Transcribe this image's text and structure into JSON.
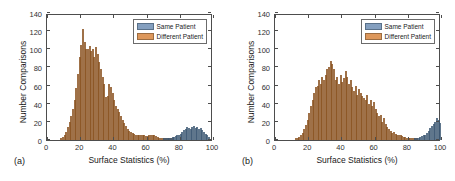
{
  "figure": {
    "panels": [
      {
        "id": "a",
        "label": "(a)",
        "xlabel": "Surface Statistics (%)",
        "ylabel": "Number Comparisons"
      },
      {
        "id": "b",
        "label": "(b)",
        "xlabel": "Surface Statistics (%)",
        "ylabel": "Number Comparisons"
      }
    ],
    "legend": {
      "position": "top-right",
      "entries": [
        {
          "label": "Same Patient",
          "color": "#6f8fb5"
        },
        {
          "label": "Different Patient",
          "color": "#d8853f"
        }
      ]
    },
    "axis": {
      "xticks": [
        "0",
        "20",
        "40",
        "60",
        "80",
        "100"
      ],
      "yticks": [
        "0",
        "20",
        "40",
        "60",
        "80",
        "100",
        "120",
        "140"
      ]
    },
    "colors": {
      "same_patient": "#6f8fb5",
      "different_patient": "#d8853f",
      "axis": "#4d4d4d",
      "background": "#ffffff"
    }
  },
  "chart_data": [
    {
      "type": "bar",
      "subplot": "(a)",
      "title": "",
      "xlabel": "Surface Statistics (%)",
      "ylabel": "Number Comparisons",
      "xlim": [
        0,
        100
      ],
      "ylim": [
        0,
        140
      ],
      "xticks": [
        0,
        20,
        40,
        60,
        80,
        100
      ],
      "yticks": [
        0,
        20,
        40,
        60,
        80,
        100,
        120,
        140
      ],
      "grid": false,
      "legend": [
        "Same Patient",
        "Different Patient"
      ],
      "bin_width": 1,
      "series": [
        {
          "name": "Different Patient",
          "color": "#d8853f",
          "x": [
            8,
            9,
            10,
            11,
            12,
            13,
            14,
            15,
            16,
            17,
            18,
            19,
            20,
            21,
            22,
            23,
            24,
            25,
            26,
            27,
            28,
            29,
            30,
            31,
            32,
            33,
            34,
            35,
            36,
            37,
            38,
            39,
            40,
            41,
            42,
            43,
            44,
            45,
            46,
            47,
            48,
            49,
            50,
            51,
            52,
            53,
            54,
            55,
            56,
            57,
            58,
            59,
            60,
            61,
            62,
            63,
            64,
            65,
            66,
            67,
            68,
            69,
            70,
            71,
            72,
            73,
            74,
            75
          ],
          "values": [
            2,
            3,
            6,
            9,
            14,
            20,
            26,
            34,
            44,
            57,
            73,
            92,
            105,
            122,
            108,
            100,
            100,
            104,
            98,
            100,
            92,
            103,
            95,
            86,
            78,
            70,
            62,
            47,
            49,
            62,
            58,
            52,
            44,
            38,
            34,
            31,
            26,
            22,
            19,
            15,
            12,
            10,
            9,
            8,
            7,
            6,
            6,
            5,
            5,
            5,
            5,
            4,
            4,
            6,
            5,
            5,
            5,
            4,
            3,
            2,
            2,
            2,
            1,
            1,
            1,
            1,
            1,
            1
          ]
        },
        {
          "name": "Same Patient",
          "color": "#6f8fb5",
          "x": [
            70,
            71,
            72,
            73,
            74,
            75,
            76,
            77,
            78,
            79,
            80,
            81,
            82,
            83,
            84,
            85,
            86,
            87,
            88,
            89,
            90,
            91,
            92,
            93,
            94,
            95,
            96,
            97
          ],
          "values": [
            1,
            1,
            2,
            2,
            2,
            3,
            3,
            4,
            5,
            6,
            7,
            9,
            11,
            12,
            14,
            13,
            12,
            14,
            15,
            13,
            14,
            12,
            13,
            11,
            9,
            7,
            5,
            3
          ]
        }
      ]
    },
    {
      "type": "bar",
      "subplot": "(b)",
      "title": "",
      "xlabel": "Surface Statistics (%)",
      "ylabel": "Number Comparisons",
      "xlim": [
        0,
        100
      ],
      "ylim": [
        0,
        140
      ],
      "xticks": [
        0,
        20,
        40,
        60,
        80,
        100
      ],
      "yticks": [
        0,
        20,
        40,
        60,
        80,
        100,
        120,
        140
      ],
      "grid": false,
      "legend": [
        "Same Patient",
        "Different Patient"
      ],
      "bin_width": 1,
      "series": [
        {
          "name": "Different Patient",
          "color": "#d8853f",
          "x": [
            12,
            13,
            14,
            15,
            16,
            17,
            18,
            19,
            20,
            21,
            22,
            23,
            24,
            25,
            26,
            27,
            28,
            29,
            30,
            31,
            32,
            33,
            34,
            35,
            36,
            37,
            38,
            39,
            40,
            41,
            42,
            43,
            44,
            45,
            46,
            47,
            48,
            49,
            50,
            51,
            52,
            53,
            54,
            55,
            56,
            57,
            58,
            59,
            60,
            61,
            62,
            63,
            64,
            65,
            66,
            67,
            68,
            69,
            70,
            71,
            72,
            73,
            74,
            75,
            76,
            77,
            78,
            79,
            80,
            81,
            82,
            83,
            84,
            85
          ],
          "values": [
            1,
            2,
            3,
            5,
            8,
            12,
            17,
            22,
            30,
            38,
            44,
            52,
            58,
            60,
            66,
            62,
            70,
            66,
            72,
            78,
            80,
            87,
            84,
            78,
            66,
            70,
            62,
            72,
            64,
            68,
            76,
            70,
            62,
            66,
            58,
            54,
            60,
            50,
            56,
            52,
            48,
            46,
            44,
            50,
            40,
            44,
            38,
            42,
            34,
            30,
            26,
            28,
            20,
            24,
            18,
            14,
            12,
            10,
            8,
            9,
            7,
            6,
            5,
            5,
            4,
            3,
            3,
            2,
            2,
            1,
            1,
            1,
            1,
            1
          ]
        },
        {
          "name": "Same Patient",
          "color": "#6f8fb5",
          "x": [
            84,
            85,
            86,
            87,
            88,
            89,
            90,
            91,
            92,
            93,
            94,
            95,
            96,
            97,
            98,
            99
          ],
          "values": [
            1,
            2,
            2,
            3,
            4,
            5,
            6,
            8,
            10,
            13,
            16,
            18,
            20,
            24,
            22,
            19
          ]
        }
      ]
    }
  ]
}
